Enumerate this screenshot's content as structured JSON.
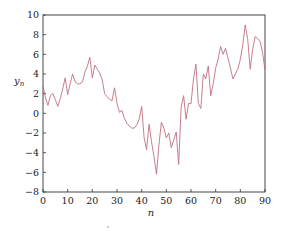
{
  "chart_data": {
    "type": "line",
    "title": "",
    "xlabel": "n",
    "ylabel": "y_n",
    "ylabel_main": "y",
    "ylabel_sub": "n",
    "xlim": [
      0,
      90
    ],
    "ylim": [
      -8,
      10
    ],
    "xticks": [
      0,
      10,
      20,
      30,
      40,
      50,
      60,
      70,
      80,
      90
    ],
    "yticks": [
      -8,
      -6,
      -4,
      -2,
      0,
      2,
      4,
      6,
      8,
      10
    ],
    "xtick_labels": [
      "0",
      "10",
      "20",
      "30",
      "40",
      "50",
      "60",
      "70",
      "80",
      "90"
    ],
    "ytick_labels": [
      "−8",
      "−6",
      "−4",
      "−2",
      "0",
      "2",
      "4",
      "6",
      "8",
      "10"
    ],
    "grid": false,
    "legend": null,
    "line_color": "#c0707f",
    "series": [
      {
        "name": "y_n",
        "x": [
          0,
          1,
          2,
          3,
          4,
          5,
          6,
          7,
          8,
          9,
          10,
          11,
          12,
          13,
          14,
          15,
          16,
          17,
          18,
          19,
          20,
          21,
          22,
          23,
          24,
          25,
          26,
          27,
          28,
          29,
          30,
          31,
          32,
          33,
          34,
          35,
          36,
          37,
          38,
          39,
          40,
          41,
          42,
          43,
          44,
          45,
          46,
          47,
          48,
          49,
          50,
          51,
          52,
          53,
          54,
          55,
          56,
          57,
          58,
          59,
          60,
          61,
          62,
          63,
          64,
          65,
          66,
          67,
          68,
          69,
          70,
          71,
          72,
          73,
          74,
          75,
          76,
          77,
          78,
          79,
          80,
          81,
          82,
          83,
          84,
          85,
          86,
          87,
          88,
          89,
          90
        ],
        "values": [
          2.8,
          1.6,
          0.8,
          1.8,
          2.0,
          1.4,
          0.7,
          1.5,
          2.5,
          3.6,
          1.9,
          3.0,
          4.0,
          3.2,
          3.0,
          3.0,
          3.2,
          4.2,
          4.8,
          5.7,
          3.6,
          4.9,
          4.5,
          4.1,
          3.4,
          2.0,
          1.7,
          1.4,
          1.3,
          2.6,
          1.0,
          0.1,
          0.3,
          -0.5,
          -1.0,
          -1.3,
          -1.5,
          -1.5,
          -1.2,
          -0.6,
          0.7,
          -2.5,
          -3.7,
          -1.1,
          -2.9,
          -4.4,
          -6.2,
          -3.2,
          -0.9,
          -1.5,
          -2.5,
          -2.0,
          -3.5,
          -2.7,
          -1.9,
          -5.2,
          0.6,
          1.8,
          -0.6,
          1.0,
          1.0,
          3.5,
          5.0,
          1.0,
          0.5,
          4.0,
          3.5,
          4.8,
          1.8,
          3.0,
          4.6,
          5.5,
          6.8,
          6.0,
          6.6,
          5.6,
          4.6,
          3.5,
          4.0,
          4.5,
          5.5,
          7.0,
          9.0,
          7.5,
          4.5,
          6.5,
          7.8,
          7.6,
          7.3,
          6.2,
          4.4
        ]
      }
    ]
  },
  "layout": {
    "plot_left": 43,
    "plot_right": 265,
    "plot_top": 15,
    "plot_bottom": 192
  }
}
